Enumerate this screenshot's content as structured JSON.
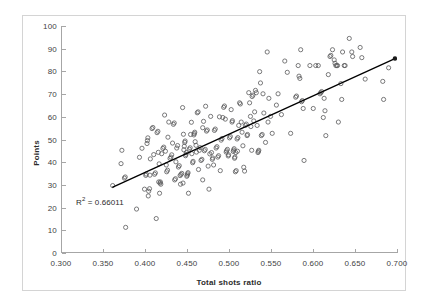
{
  "chart_data": {
    "type": "scatter",
    "title": "",
    "subtitle": "",
    "xlabel": "Total shots ratio",
    "ylabel": "Points",
    "xlim": [
      0.3,
      0.7
    ],
    "ylim": [
      0,
      100
    ],
    "xticks": [
      "0.300",
      "0.350",
      "0.400",
      "0.450",
      "0.500",
      "0.550",
      "0.600",
      "0.650",
      "0.700"
    ],
    "xtick_values": [
      0.3,
      0.35,
      0.4,
      0.45,
      0.5,
      0.55,
      0.6,
      0.65,
      0.7
    ],
    "yticks": [
      "0",
      "10",
      "20",
      "30",
      "40",
      "50",
      "60",
      "70",
      "80",
      "90",
      "100"
    ],
    "ytick_values": [
      0,
      10,
      20,
      30,
      40,
      50,
      60,
      70,
      80,
      90,
      100
    ],
    "grid": false,
    "legend": false,
    "legend_position": "none",
    "marker": {
      "shape": "circle-open",
      "radius": 2.1,
      "stroke": "#59595b",
      "stroke_width": 0.8,
      "fill": "none"
    },
    "annotations": [
      {
        "name": "r-squared",
        "text_prefix": "R",
        "text_superscript": "2",
        "text_suffix": " = 0.66011",
        "full_text": "R² = 0.66011",
        "x": 0.318,
        "y": 23.0,
        "color": "#2b2b2b"
      }
    ],
    "trendline": {
      "type": "linear",
      "r_squared": 0.66011,
      "color": "#000000",
      "width": 1.3,
      "x_start": 0.36,
      "y_start": 28.6,
      "x_end": 0.6975,
      "y_end": 85.6,
      "end_marker": {
        "shape": "circle-filled",
        "radius": 2.2,
        "fill": "#1a1a1a"
      }
    },
    "points": [
      [
        0.3605,
        29.4
      ],
      [
        0.3745,
        32.7
      ],
      [
        0.3755,
        33.2
      ],
      [
        0.376,
        10.9
      ],
      [
        0.3715,
        45.0
      ],
      [
        0.3705,
        39.1
      ],
      [
        0.389,
        19.0
      ],
      [
        0.3925,
        41.9
      ],
      [
        0.3955,
        45.9
      ],
      [
        0.3985,
        27.8
      ],
      [
        0.4,
        33.9
      ],
      [
        0.4005,
        34.5
      ],
      [
        0.4015,
        48.0
      ],
      [
        0.402,
        49.3
      ],
      [
        0.4025,
        50.5
      ],
      [
        0.403,
        24.8
      ],
      [
        0.4035,
        26.9
      ],
      [
        0.4045,
        28.0
      ],
      [
        0.405,
        34.0
      ],
      [
        0.4055,
        41.2
      ],
      [
        0.4075,
        54.6
      ],
      [
        0.4085,
        55.1
      ],
      [
        0.4095,
        43.1
      ],
      [
        0.4105,
        34.4
      ],
      [
        0.4115,
        35.0
      ],
      [
        0.4125,
        14.8
      ],
      [
        0.4135,
        52.8
      ],
      [
        0.4145,
        53.4
      ],
      [
        0.415,
        44.1
      ],
      [
        0.416,
        39.0
      ],
      [
        0.4165,
        26.0
      ],
      [
        0.417,
        30.5
      ],
      [
        0.4175,
        31.0
      ],
      [
        0.418,
        30.0
      ],
      [
        0.419,
        43.5
      ],
      [
        0.4205,
        45.8
      ],
      [
        0.4215,
        46.4
      ],
      [
        0.4225,
        60.6
      ],
      [
        0.4235,
        44.6
      ],
      [
        0.4245,
        38.5
      ],
      [
        0.425,
        35.5
      ],
      [
        0.426,
        36.2
      ],
      [
        0.4265,
        50.8
      ],
      [
        0.4275,
        57.5
      ],
      [
        0.429,
        41.4
      ],
      [
        0.43,
        42.0
      ],
      [
        0.431,
        43.0
      ],
      [
        0.432,
        48.2
      ],
      [
        0.433,
        56.5
      ],
      [
        0.434,
        57.1
      ],
      [
        0.4345,
        31.9
      ],
      [
        0.4355,
        32.4
      ],
      [
        0.436,
        39.9
      ],
      [
        0.437,
        46.0
      ],
      [
        0.438,
        47.1
      ],
      [
        0.439,
        37.6
      ],
      [
        0.44,
        38.2
      ],
      [
        0.441,
        33.8
      ],
      [
        0.442,
        34.3
      ],
      [
        0.443,
        34.8
      ],
      [
        0.444,
        63.9
      ],
      [
        0.445,
        52.1
      ],
      [
        0.4455,
        45.2
      ],
      [
        0.446,
        46.8
      ],
      [
        0.4465,
        48.5
      ],
      [
        0.447,
        49.1
      ],
      [
        0.4475,
        42.6
      ],
      [
        0.448,
        43.2
      ],
      [
        0.4485,
        44.0
      ],
      [
        0.449,
        33.5
      ],
      [
        0.4495,
        34.0
      ],
      [
        0.45,
        34.6
      ],
      [
        0.4505,
        35.1
      ],
      [
        0.451,
        26.0
      ],
      [
        0.452,
        45.5
      ],
      [
        0.453,
        46.1
      ],
      [
        0.4535,
        52.0
      ],
      [
        0.4545,
        57.4
      ],
      [
        0.455,
        43.5
      ],
      [
        0.456,
        39.5
      ],
      [
        0.4565,
        40.1
      ],
      [
        0.4575,
        51.8
      ],
      [
        0.458,
        52.4
      ],
      [
        0.4585,
        53.0
      ],
      [
        0.459,
        48.8
      ],
      [
        0.46,
        47.2
      ],
      [
        0.4605,
        44.2
      ],
      [
        0.4615,
        61.6
      ],
      [
        0.4625,
        62.0
      ],
      [
        0.463,
        36.5
      ],
      [
        0.464,
        45.0
      ],
      [
        0.465,
        46.2
      ],
      [
        0.466,
        40.5
      ],
      [
        0.467,
        41.0
      ],
      [
        0.468,
        31.9
      ],
      [
        0.469,
        57.8
      ],
      [
        0.47,
        44.8
      ],
      [
        0.471,
        45.4
      ],
      [
        0.4715,
        64.5
      ],
      [
        0.4725,
        53.5
      ],
      [
        0.4735,
        54.0
      ],
      [
        0.4745,
        38.0
      ],
      [
        0.4755,
        27.8
      ],
      [
        0.4765,
        43.4
      ],
      [
        0.4775,
        60.0
      ],
      [
        0.4785,
        44.0
      ],
      [
        0.4795,
        41.0
      ],
      [
        0.48,
        41.6
      ],
      [
        0.481,
        38.5
      ],
      [
        0.482,
        53.8
      ],
      [
        0.483,
        54.4
      ],
      [
        0.484,
        46.0
      ],
      [
        0.485,
        46.6
      ],
      [
        0.486,
        42.0
      ],
      [
        0.487,
        42.6
      ],
      [
        0.488,
        59.8
      ],
      [
        0.489,
        36.0
      ],
      [
        0.49,
        49.5
      ],
      [
        0.491,
        50.2
      ],
      [
        0.492,
        59.5
      ],
      [
        0.493,
        64.0
      ],
      [
        0.494,
        64.6
      ],
      [
        0.495,
        58.8
      ],
      [
        0.496,
        44.2
      ],
      [
        0.4965,
        44.8
      ],
      [
        0.4975,
        45.4
      ],
      [
        0.4985,
        42.5
      ],
      [
        0.499,
        43.0
      ],
      [
        0.5,
        50.5
      ],
      [
        0.501,
        51.1
      ],
      [
        0.502,
        63.0
      ],
      [
        0.503,
        57.5
      ],
      [
        0.5035,
        58.1
      ],
      [
        0.5045,
        44.5
      ],
      [
        0.505,
        45.1
      ],
      [
        0.5055,
        45.7
      ],
      [
        0.506,
        41.5
      ],
      [
        0.5065,
        42.0
      ],
      [
        0.507,
        35.5
      ],
      [
        0.508,
        36.0
      ],
      [
        0.509,
        50.0
      ],
      [
        0.51,
        50.6
      ],
      [
        0.511,
        56.0
      ],
      [
        0.512,
        66.0
      ],
      [
        0.513,
        65.5
      ],
      [
        0.514,
        57.5
      ],
      [
        0.515,
        53.0
      ],
      [
        0.516,
        47.0
      ],
      [
        0.517,
        37.5
      ],
      [
        0.518,
        35.8
      ],
      [
        0.519,
        56.0
      ],
      [
        0.52,
        56.6
      ],
      [
        0.521,
        51.5
      ],
      [
        0.5215,
        52.0
      ],
      [
        0.523,
        70.5
      ],
      [
        0.524,
        66.0
      ],
      [
        0.525,
        60.0
      ],
      [
        0.5255,
        55.5
      ],
      [
        0.5265,
        45.0
      ],
      [
        0.527,
        68.8
      ],
      [
        0.528,
        69.4
      ],
      [
        0.529,
        58.0
      ],
      [
        0.53,
        62.0
      ],
      [
        0.531,
        71.5
      ],
      [
        0.532,
        70.5
      ],
      [
        0.533,
        56.0
      ],
      [
        0.534,
        44.0
      ],
      [
        0.5345,
        44.5
      ],
      [
        0.535,
        45.0
      ],
      [
        0.536,
        79.8
      ],
      [
        0.537,
        74.8
      ],
      [
        0.538,
        51.5
      ],
      [
        0.539,
        52.0
      ],
      [
        0.54,
        70.0
      ],
      [
        0.541,
        61.5
      ],
      [
        0.543,
        48.5
      ],
      [
        0.545,
        88.5
      ],
      [
        0.546,
        57.5
      ],
      [
        0.547,
        68.0
      ],
      [
        0.549,
        60.0
      ],
      [
        0.551,
        52.5
      ],
      [
        0.556,
        65.0
      ],
      [
        0.558,
        70.0
      ],
      [
        0.562,
        60.8
      ],
      [
        0.566,
        84.5
      ],
      [
        0.569,
        79.5
      ],
      [
        0.573,
        52.5
      ],
      [
        0.579,
        68.5
      ],
      [
        0.58,
        69.0
      ],
      [
        0.582,
        82.5
      ],
      [
        0.583,
        77.8
      ],
      [
        0.584,
        76.8
      ],
      [
        0.585,
        89.5
      ],
      [
        0.586,
        66.5
      ],
      [
        0.587,
        67.0
      ],
      [
        0.588,
        63.5
      ],
      [
        0.589,
        40.5
      ],
      [
        0.596,
        82.5
      ],
      [
        0.6,
        63.5
      ],
      [
        0.603,
        82.5
      ],
      [
        0.606,
        82.5
      ],
      [
        0.608,
        70.0
      ],
      [
        0.609,
        70.5
      ],
      [
        0.61,
        71.0
      ],
      [
        0.612,
        59.5
      ],
      [
        0.613,
        68.0
      ],
      [
        0.614,
        62.5
      ],
      [
        0.615,
        51.5
      ],
      [
        0.618,
        78.5
      ],
      [
        0.62,
        86.5
      ],
      [
        0.621,
        87.0
      ],
      [
        0.623,
        89.5
      ],
      [
        0.625,
        85.0
      ],
      [
        0.626,
        83.5
      ],
      [
        0.627,
        82.5
      ],
      [
        0.628,
        82.5
      ],
      [
        0.629,
        82.5
      ],
      [
        0.63,
        57.5
      ],
      [
        0.633,
        74.5
      ],
      [
        0.634,
        67.5
      ],
      [
        0.635,
        88.5
      ],
      [
        0.637,
        82.5
      ],
      [
        0.638,
        82.5
      ],
      [
        0.643,
        94.5
      ],
      [
        0.646,
        88.5
      ],
      [
        0.647,
        86.5
      ],
      [
        0.656,
        90.5
      ],
      [
        0.658,
        86.0
      ],
      [
        0.662,
        76.5
      ],
      [
        0.683,
        75.5
      ],
      [
        0.684,
        67.5
      ],
      [
        0.69,
        81.5
      ],
      [
        0.4445,
        30.5
      ],
      [
        0.4415,
        30.0
      ],
      [
        0.4155,
        31.0
      ],
      [
        0.468,
        55.0
      ],
      [
        0.5075,
        44.0
      ],
      [
        0.5095,
        44.6
      ]
    ]
  }
}
